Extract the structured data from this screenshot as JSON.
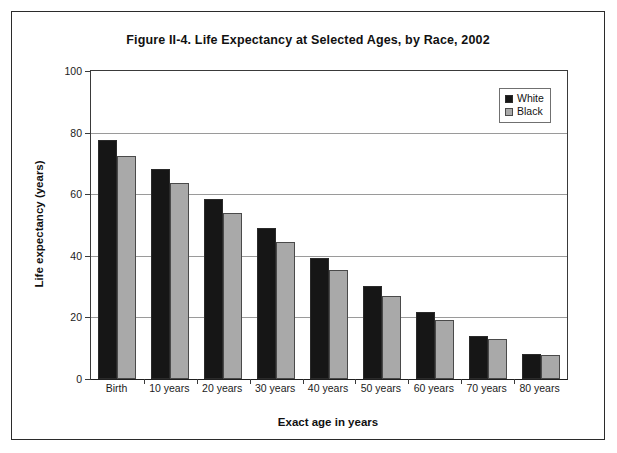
{
  "figure": {
    "title": "Figure II-4. Life Expectancy at Selected Ages, by Race, 2002",
    "border_color": "#2b2b2b"
  },
  "legend": {
    "position": "top-right-inside",
    "entries": [
      {
        "label": "White",
        "color": "#161616",
        "swatch_name": "legend-swatch-white"
      },
      {
        "label": "Black",
        "color": "#a9a9a9",
        "swatch_name": "legend-swatch-black"
      }
    ]
  },
  "axes": {
    "y": {
      "label": "Life expectancy (years)",
      "ticks": [
        "0",
        "20",
        "40",
        "60",
        "80",
        "100"
      ],
      "min": 0,
      "max": 100,
      "step": 20
    },
    "x": {
      "label": "Exact age in years"
    }
  },
  "chart_data": {
    "type": "bar",
    "title": "Figure II-4. Life Expectancy at Selected Ages, by Race, 2002",
    "xlabel": "Exact age in years",
    "ylabel": "Life expectancy (years)",
    "ylim": [
      0,
      100
    ],
    "ytick_step": 20,
    "grid": true,
    "legend_position": "upper right",
    "categories": [
      "Birth",
      "10 years",
      "20 years",
      "30 years",
      "40 years",
      "50 years",
      "60 years",
      "70 years",
      "80 years"
    ],
    "series": [
      {
        "name": "White",
        "color": "#161616",
        "values": [
          77.7,
          68.2,
          58.5,
          48.9,
          39.3,
          30.2,
          21.6,
          14.1,
          8.1
        ]
      },
      {
        "name": "Black",
        "color": "#a9a9a9",
        "values": [
          72.3,
          63.5,
          53.9,
          44.5,
          35.4,
          26.9,
          19.2,
          12.9,
          7.7
        ]
      }
    ]
  }
}
